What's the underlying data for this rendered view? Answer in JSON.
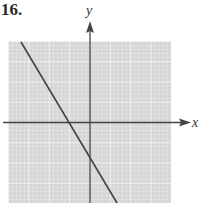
{
  "problem": {
    "number": "16."
  },
  "graph": {
    "x_axis_label": "x",
    "y_axis_label": "y",
    "grid": {
      "cells_x": 40,
      "cells_y": 40,
      "major_every": 5,
      "background": "#d9d9d9",
      "minor_color": "#eeeeee",
      "major_color": "#ffffff"
    },
    "line": {
      "description": "straight line with negative slope, crossing x-axis left of origin and y-axis below origin",
      "color": "#444444"
    },
    "axis_color": "#444444"
  }
}
